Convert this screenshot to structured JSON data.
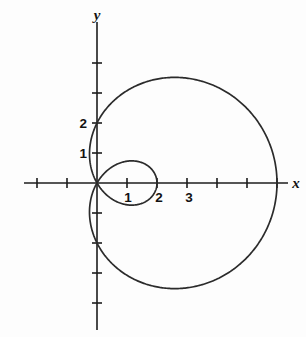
{
  "figure": {
    "title": "",
    "background_color": "#fdfdfd",
    "curve_color": "#2b2b2b",
    "axis_color": "#1c1c1c"
  },
  "axes": {
    "x_label": "x",
    "y_label": "y",
    "origin_px": {
      "x": 97,
      "y": 183
    },
    "unit_px": 30,
    "x_axis_extent_px": {
      "start": 24,
      "end": 288
    },
    "y_axis_extent_px": {
      "start": 22,
      "end": 330
    },
    "x_tick_labels": [
      "1",
      "2",
      "3"
    ],
    "y_tick_labels": [
      "1",
      "2"
    ],
    "x_tick_values": [
      -2,
      -1,
      1,
      2,
      3,
      4,
      5,
      6
    ],
    "y_tick_values": [
      -4,
      -3,
      -2,
      -1,
      1,
      2,
      3,
      4
    ],
    "x_labeled_values": [
      1,
      2,
      3
    ],
    "y_labeled_values": [
      1,
      2
    ],
    "tick_half_length_px": 5
  },
  "chart_data": {
    "type": "line",
    "title": "",
    "xlabel": "x",
    "ylabel": "y",
    "grid": false,
    "legend": "none",
    "xlim": [
      -2.5,
      6.4
    ],
    "ylim": [
      -5,
      5.4
    ],
    "curve_family": "limacon-with-inner-loop",
    "polar_equation": "r = 2 + 4*cos(theta)",
    "parameters": {
      "a": 2,
      "b": 4
    },
    "key_points": {
      "outer_x_intercept": 6,
      "outer_y_intercepts": [
        2,
        -2
      ],
      "inner_loop_x_extent": 2,
      "outer_top_y": 3.05,
      "outer_bottom_y": -3.05,
      "pole": [
        0,
        0
      ]
    },
    "series": [
      {
        "name": "limacon r = 2 + 4 cos(theta)",
        "theta_start_deg": 0,
        "theta_end_deg": 360,
        "points": [
          [
            6.0,
            0.0
          ],
          [
            5.88,
            0.53
          ],
          [
            5.55,
            1.04
          ],
          [
            5.02,
            1.5
          ],
          [
            4.33,
            1.86
          ],
          [
            3.54,
            2.1
          ],
          [
            2.69,
            2.2
          ],
          [
            1.85,
            2.16
          ],
          [
            1.06,
            1.97
          ],
          [
            0.37,
            1.65
          ],
          [
            -0.18,
            1.22
          ],
          [
            -0.55,
            0.72
          ],
          [
            -0.73,
            0.18
          ],
          [
            -0.7,
            -0.37
          ],
          [
            -0.47,
            -0.85
          ],
          [
            -0.07,
            -1.2
          ],
          [
            0.45,
            -1.39
          ],
          [
            1.05,
            -1.39
          ],
          [
            1.67,
            -1.2
          ],
          [
            2.24,
            -0.83
          ],
          [
            2.0,
            0.0
          ],
          [
            1.72,
            0.52
          ],
          [
            1.2,
            0.77
          ],
          [
            0.62,
            0.78
          ],
          [
            0.15,
            0.55
          ],
          [
            0.0,
            0.0
          ]
        ]
      }
    ]
  }
}
